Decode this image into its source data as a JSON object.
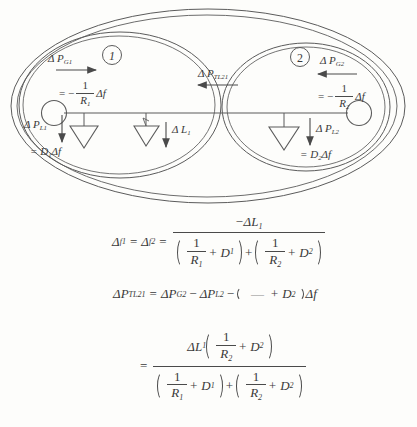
{
  "document": {
    "type": "scanned-textbook-figure",
    "title_visible": false
  },
  "figure": {
    "name": "two-area-interconnected-power-system",
    "areas": [
      {
        "id": "area-1",
        "circle_label": "1",
        "generator_label_line1": "Δ P",
        "generator_label_sub": "G1",
        "generator_value": "= −",
        "generator_frac_num": "1",
        "generator_frac_den": "R",
        "generator_frac_den_sub": "1",
        "generator_value_tail": "Δf",
        "generator_arrow_direction": "right",
        "load_label": "Δ P",
        "load_label_sub": "L1",
        "load_value": "= D",
        "load_value_sub": "1",
        "load_value_tail": "Δf"
      },
      {
        "id": "area-2",
        "circle_label": "2",
        "generator_label_line1": "Δ P",
        "generator_label_sub": "G2",
        "generator_value": "= −",
        "generator_frac_num": "1",
        "generator_frac_den": "R",
        "generator_frac_den_sub": "2",
        "generator_value_tail": "Δf",
        "generator_arrow_direction": "left",
        "load_label": "Δ P",
        "load_label_sub": "L2",
        "load_value": "= D",
        "load_value_sub": "2",
        "load_value_tail": "Δf"
      }
    ],
    "tie_line": {
      "label": "Δ P",
      "label_sub": "TL21",
      "arrow_direction": "left"
    },
    "disturbance_load": {
      "label": "Δ L",
      "label_sub": "1",
      "arrow_direction": "down"
    }
  },
  "equations": {
    "eq1": {
      "lhs_a": "Δ",
      "lhs_a_sub": "f1",
      "eq_sign_1": "=",
      "lhs_b": "Δ",
      "lhs_b_sub": "f2",
      "eq_sign_2": "=",
      "numerator": "−ΔL",
      "numerator_sub": "1",
      "den_one_a": "1",
      "den_R_a": "R",
      "den_R_a_sub": "1",
      "den_plus_a": "+ D",
      "den_D_a_sub": "1",
      "den_join": "+",
      "den_one_b": "1",
      "den_R_b": "R",
      "den_R_b_sub": "2",
      "den_plus_b": "+ D",
      "den_D_b_sub": "2"
    },
    "eq2": {
      "lhs": "ΔP",
      "lhs_sub": "TL21",
      "eq_sign": "=",
      "term1": "ΔP",
      "term1_sub": "G2",
      "minus1": "−",
      "term2": "ΔP",
      "term2_sub": "L2",
      "minus2": "−",
      "faded_fraction_bar": "—",
      "paren_plus": "+ D",
      "paren_D_sub": "2",
      "tail": "Δf"
    },
    "eq3": {
      "eq_sign": "=",
      "num_delta": "ΔL",
      "num_delta_sub": "1",
      "num_one": "1",
      "num_R": "R",
      "num_R_sub": "2",
      "num_plus": "+ D",
      "num_D_sub": "2",
      "den_one_a": "1",
      "den_R_a": "R",
      "den_R_a_sub": "1",
      "den_plus_a": "+ D",
      "den_D_a_sub": "1",
      "den_join": "+",
      "den_one_b": "1",
      "den_R_b": "R",
      "den_R_b_sub": "2",
      "den_plus_b": "+ D",
      "den_D_b_sub": "2"
    }
  },
  "colors": {
    "ink": "#3a3a3a",
    "line": "#4a4a4a",
    "background": "#fdfdfb"
  }
}
